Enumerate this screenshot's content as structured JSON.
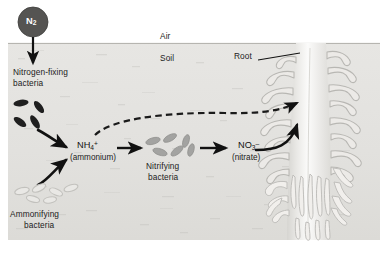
{
  "figure": {
    "width": 385,
    "height": 253
  },
  "colors": {
    "page_background": "#ffffff",
    "soil_fill": "#e4e3e0",
    "soil_fill_dark": "#dbdad6",
    "air_fill": "#ffffff",
    "n2_circle": "#4f4f4f",
    "n2_label": "#ffffff",
    "arrow_black": "#111111",
    "dashed_arrow": "#1a1a1a",
    "nitrogen_fixing_bacteria": "#1e1e1e",
    "nitrifying_bacteria": "#9c9c9c",
    "ammonifying_bacteria_stroke": "#c9c9c6",
    "root_body": "#efeeec",
    "root_outline": "#b9b8b4",
    "text": "#1b1b1b"
  },
  "zones": {
    "air_label": "Air",
    "soil_label": "Soil",
    "root_label": "Root"
  },
  "nodes": {
    "n2": {
      "symbol": "N",
      "subscript": "2",
      "name": "nitrogen-gas-molecule"
    },
    "nitrogen_fixing": {
      "line1": "Nitrogen-fixing",
      "line2": "bacteria"
    },
    "ammonium": {
      "formula_main": "NH",
      "formula_sub": "4",
      "formula_sup": "+",
      "caption": "(ammonium)"
    },
    "nitrifying": {
      "line1": "Nitrifying",
      "line2": "bacteria"
    },
    "nitrate": {
      "formula_main": "NO",
      "formula_sub": "3",
      "formula_sup": "–",
      "caption": "(nitrate)"
    },
    "ammonifying": {
      "line1": "Ammonifying",
      "line2": "bacteria"
    }
  },
  "arrows": [
    {
      "id": "n2-to-fixers",
      "style": "solid",
      "label": ""
    },
    {
      "id": "fixers-to-ammonium",
      "style": "solid",
      "label": ""
    },
    {
      "id": "ammonifiers-to-ammonium",
      "style": "solid",
      "label": ""
    },
    {
      "id": "ammonium-to-nitrifiers",
      "style": "solid",
      "label": ""
    },
    {
      "id": "nitrifiers-to-nitrate",
      "style": "solid",
      "label": ""
    },
    {
      "id": "ammonium-uptake-by-root",
      "style": "dashed",
      "label": ""
    },
    {
      "id": "nitrate-uptake-by-root",
      "style": "solid",
      "label": ""
    }
  ]
}
